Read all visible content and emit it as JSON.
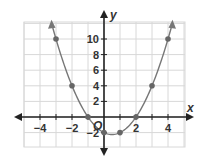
{
  "chart_data": {
    "type": "line",
    "title": "",
    "xlabel": "x",
    "ylabel": "y",
    "origin_label": "O",
    "xlim": [
      -5,
      5
    ],
    "ylim": [
      -4,
      12
    ],
    "grid": true,
    "x_ticks": [
      -4,
      -2,
      2,
      4
    ],
    "x_tick_labels": [
      "−4",
      "−2",
      "2",
      "4"
    ],
    "y_ticks": [
      -2,
      2,
      4,
      6,
      8,
      10
    ],
    "y_tick_labels": [
      "−2",
      "2",
      "4",
      "6",
      "8",
      "10"
    ],
    "series": [
      {
        "name": "parabola",
        "equation": "y = x^2 - x - 2",
        "x": [
          -3,
          -2,
          -1,
          0,
          1,
          2,
          3,
          4
        ],
        "y": [
          10,
          4,
          0,
          -2,
          -2,
          0,
          4,
          10
        ]
      }
    ],
    "colors": {
      "curve": "#777777",
      "points": "#666666",
      "axes": "#222222",
      "grid": "#d8d8d8"
    }
  }
}
